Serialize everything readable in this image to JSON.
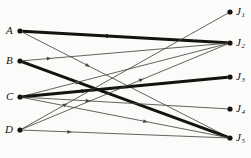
{
  "figure": {
    "type": "bipartite-assignment-digraph",
    "title": "",
    "background_color": "#fbfbfa",
    "ink_color": "#15130f",
    "thin_color": "#4a4643",
    "width": 251,
    "height": 158
  },
  "left_nodes": [
    {
      "id": "A",
      "label": "A",
      "sub": "",
      "x": 20,
      "y": 31,
      "label_x": 6,
      "label_y": 25
    },
    {
      "id": "B",
      "label": "B",
      "sub": "",
      "x": 20,
      "y": 61,
      "label_x": 6,
      "label_y": 55
    },
    {
      "id": "C",
      "label": "C",
      "sub": "",
      "x": 20,
      "y": 97,
      "label_x": 6,
      "label_y": 91
    },
    {
      "id": "D",
      "label": "D",
      "sub": "",
      "x": 20,
      "y": 130,
      "label_x": 5,
      "label_y": 124
    }
  ],
  "right_nodes": [
    {
      "id": "J1",
      "label": "J",
      "sub": "1",
      "x": 230,
      "y": 12,
      "label_x": 236,
      "label_y": 6
    },
    {
      "id": "J2",
      "label": "J",
      "sub": "2",
      "x": 230,
      "y": 43,
      "label_x": 236,
      "label_y": 37
    },
    {
      "id": "J3",
      "label": "J",
      "sub": "3",
      "x": 230,
      "y": 77,
      "label_x": 236,
      "label_y": 71
    },
    {
      "id": "J4",
      "label": "J",
      "sub": "4",
      "x": 230,
      "y": 109,
      "label_x": 236,
      "label_y": 103
    },
    {
      "id": "J5",
      "label": "J",
      "sub": "5",
      "x": 230,
      "y": 138,
      "label_x": 236,
      "label_y": 132
    }
  ],
  "edges": [
    {
      "from": "A",
      "to": "J2",
      "weight": "heavy",
      "width": 3.0,
      "arrow_t": 0.42
    },
    {
      "from": "A",
      "to": "J5",
      "weight": "light",
      "width": 0.85,
      "arrow_t": 0.32
    },
    {
      "from": "B",
      "to": "J5",
      "weight": "heavy",
      "width": 3.0,
      "arrow_t": 0.4
    },
    {
      "from": "B",
      "to": "J2",
      "weight": "light",
      "width": 0.85,
      "arrow_t": 0.13
    },
    {
      "from": "C",
      "to": "J2",
      "weight": "light",
      "width": 0.85,
      "arrow_t": 0.27
    },
    {
      "from": "C",
      "to": "J3",
      "weight": "heavy",
      "width": 3.0,
      "arrow_t": 0.3
    },
    {
      "from": "C",
      "to": "J4",
      "weight": "light",
      "width": 0.85,
      "arrow_t": 0.32
    },
    {
      "from": "C",
      "to": "J5",
      "weight": "light",
      "width": 0.85,
      "arrow_t": 0.6
    },
    {
      "from": "D",
      "to": "J1",
      "weight": "light",
      "width": 0.85,
      "arrow_t": 0.21
    },
    {
      "from": "D",
      "to": "J5",
      "weight": "light",
      "width": 0.85,
      "arrow_t": 0.23
    },
    {
      "from": "D",
      "to": "J2",
      "weight": "light",
      "width": 0.85,
      "arrow_t": 0.58
    }
  ],
  "node_radius": 2.6
}
